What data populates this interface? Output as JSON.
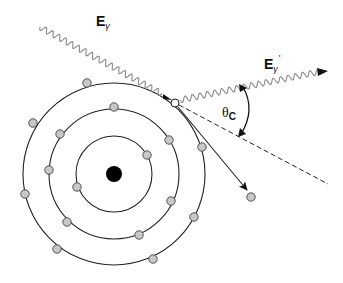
{
  "diagram": {
    "labels": {
      "incident_photon": {
        "symbol": "E",
        "subscript": "γ"
      },
      "scattered_photon": {
        "symbol": "E",
        "subscript": "γ",
        "prime": "'"
      },
      "scatter_angle": {
        "symbol": "θ",
        "subscript": "C"
      }
    },
    "colors": {
      "orbit": "#222222",
      "electron_fill": "#c8c8c8",
      "nucleus": "#000000",
      "photon_wave": "#8a8a8a",
      "line": "#222222"
    },
    "nucleus": {
      "cx": 114,
      "cy": 174,
      "r": 8
    },
    "orbits": [
      {
        "r": 38
      },
      {
        "r": 65
      },
      {
        "r": 91
      }
    ],
    "electrons": [
      {
        "cx": 147,
        "cy": 155
      },
      {
        "cx": 77,
        "cy": 187
      },
      {
        "cx": 114,
        "cy": 107
      },
      {
        "cx": 60,
        "cy": 134
      },
      {
        "cx": 169,
        "cy": 140
      },
      {
        "cx": 49,
        "cy": 170
      },
      {
        "cx": 171,
        "cy": 201
      },
      {
        "cx": 67,
        "cy": 222
      },
      {
        "cx": 139,
        "cy": 235
      },
      {
        "cx": 87,
        "cy": 83
      },
      {
        "cx": 33,
        "cy": 123
      },
      {
        "cx": 25,
        "cy": 194
      },
      {
        "cx": 57,
        "cy": 249
      },
      {
        "cx": 153,
        "cy": 259
      },
      {
        "cx": 194,
        "cy": 217
      },
      {
        "cx": 202,
        "cy": 147
      }
    ],
    "target_electron": {
      "cx": 175,
      "cy": 103
    },
    "ejected_electron": {
      "cx": 251,
      "cy": 197
    }
  }
}
